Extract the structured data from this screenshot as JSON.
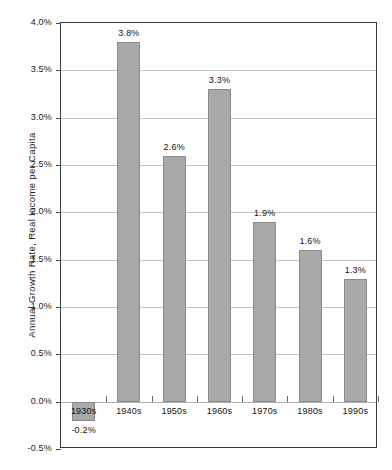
{
  "chart_data": {
    "type": "bar",
    "title": "",
    "xlabel": "",
    "ylabel": "Annual Growth Rate, Real Income per Capita",
    "categories": [
      "1930s",
      "1940s",
      "1950s",
      "1960s",
      "1970s",
      "1980s",
      "1990s"
    ],
    "values": [
      -0.2,
      3.8,
      2.6,
      3.3,
      1.9,
      1.6,
      1.3
    ],
    "value_labels": [
      "-0.2%",
      "3.8%",
      "2.6%",
      "3.3%",
      "1.9%",
      "1.6%",
      "1.3%"
    ],
    "ylim": [
      -0.5,
      4.0
    ],
    "ytick_labels": [
      "4.0%",
      "3.5%",
      "3.0%",
      "2.5%",
      "2.0%",
      "1.5%",
      "1.0%",
      "0.5%",
      "0.0%",
      "-0.5%"
    ],
    "ytick_values": [
      4.0,
      3.5,
      3.0,
      2.5,
      2.0,
      1.5,
      1.0,
      0.5,
      0.0,
      -0.5
    ],
    "grid": true,
    "legend": false,
    "colors": {
      "bar_fill": "#a9a9a9",
      "bar_border": "#8a8a8a",
      "gridline": "#c4c4c4",
      "frame": "#3a3a3a",
      "background": "#ffffff",
      "text": "#111111"
    }
  }
}
